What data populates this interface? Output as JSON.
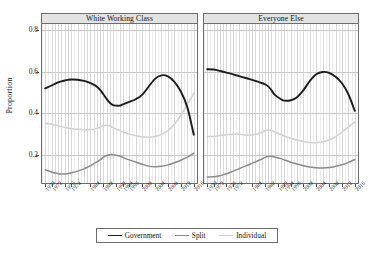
{
  "chart_data": {
    "type": "line",
    "title": "",
    "xlabel": "",
    "ylabel": "Proportion",
    "ylim": [
      0.06,
      0.83
    ],
    "yticks": [
      0.2,
      0.4,
      0.6,
      0.8
    ],
    "ytick_labels": [
      "0.2",
      "0.4",
      "0.6",
      "0.8"
    ],
    "grid": true,
    "legend_position": "bottom",
    "x": [
      1970,
      1972,
      1973,
      1974,
      1975,
      1976,
      1977,
      1978,
      1980,
      1982,
      1983,
      1984,
      1985,
      1986,
      1987,
      1988,
      1989,
      1990,
      1991,
      1993,
      1994,
      1996,
      1998,
      2000,
      2002,
      2004,
      2006,
      2008,
      2010,
      2012,
      2014,
      2016
    ],
    "xtick_labels": [
      "1970",
      "1972",
      "1976",
      "1978",
      "1984",
      "1988",
      "1992",
      "1994",
      "1996",
      "2000",
      "2004",
      "2008",
      "2012",
      "2016"
    ],
    "xtick_values": [
      1970,
      1972,
      1976,
      1978,
      1984,
      1988,
      1992,
      1994,
      1996,
      2000,
      2004,
      2008,
      2012,
      2016
    ],
    "xlim": [
      1969,
      2017
    ],
    "panels": [
      {
        "title": "White Working Class",
        "series": [
          {
            "name": "Government",
            "color": "#1c1c1c",
            "width": 1.9,
            "values": [
              0.52,
              0.534,
              0.542,
              0.549,
              0.554,
              0.558,
              0.561,
              0.563,
              0.562,
              0.556,
              0.551,
              0.545,
              0.538,
              0.528,
              0.513,
              0.492,
              0.47,
              0.451,
              0.44,
              0.437,
              0.443,
              0.455,
              0.468,
              0.489,
              0.528,
              0.566,
              0.583,
              0.578,
              0.552,
              0.505,
              0.43,
              0.297
            ]
          },
          {
            "name": "Split",
            "color": "#8a8a8a",
            "width": 1.5,
            "values": [
              0.128,
              0.118,
              0.113,
              0.11,
              0.108,
              0.108,
              0.11,
              0.113,
              0.122,
              0.133,
              0.14,
              0.148,
              0.157,
              0.166,
              0.176,
              0.189,
              0.197,
              0.201,
              0.201,
              0.195,
              0.188,
              0.176,
              0.166,
              0.155,
              0.146,
              0.143,
              0.145,
              0.152,
              0.162,
              0.174,
              0.189,
              0.208
            ]
          },
          {
            "name": "Individual",
            "color": "#d2d2d2",
            "width": 1.5,
            "values": [
              0.352,
              0.348,
              0.344,
              0.34,
              0.336,
              0.332,
              0.329,
              0.327,
              0.323,
              0.321,
              0.321,
              0.322,
              0.324,
              0.328,
              0.333,
              0.34,
              0.343,
              0.34,
              0.331,
              0.318,
              0.311,
              0.3,
              0.293,
              0.287,
              0.285,
              0.289,
              0.299,
              0.317,
              0.348,
              0.391,
              0.443,
              0.496
            ]
          }
        ]
      },
      {
        "title": "Everyone Else",
        "series": [
          {
            "name": "Government",
            "color": "#1c1c1c",
            "width": 1.9,
            "values": [
              0.612,
              0.611,
              0.608,
              0.604,
              0.6,
              0.596,
              0.592,
              0.588,
              0.579,
              0.57,
              0.566,
              0.561,
              0.556,
              0.551,
              0.546,
              0.54,
              0.53,
              0.512,
              0.49,
              0.468,
              0.461,
              0.463,
              0.478,
              0.512,
              0.556,
              0.588,
              0.599,
              0.595,
              0.576,
              0.545,
              0.492,
              0.412
            ]
          },
          {
            "name": "Split",
            "color": "#8a8a8a",
            "width": 1.5,
            "values": [
              0.094,
              0.095,
              0.097,
              0.1,
              0.104,
              0.109,
              0.115,
              0.121,
              0.134,
              0.147,
              0.153,
              0.159,
              0.166,
              0.173,
              0.18,
              0.188,
              0.192,
              0.193,
              0.19,
              0.182,
              0.176,
              0.165,
              0.156,
              0.148,
              0.142,
              0.138,
              0.137,
              0.139,
              0.145,
              0.153,
              0.164,
              0.178
            ]
          },
          {
            "name": "Individual",
            "color": "#d2d2d2",
            "width": 1.5,
            "values": [
              0.288,
              0.289,
              0.291,
              0.293,
              0.295,
              0.297,
              0.298,
              0.299,
              0.299,
              0.296,
              0.295,
              0.296,
              0.299,
              0.303,
              0.309,
              0.316,
              0.32,
              0.318,
              0.31,
              0.298,
              0.291,
              0.28,
              0.272,
              0.265,
              0.26,
              0.259,
              0.263,
              0.272,
              0.288,
              0.309,
              0.334,
              0.358
            ]
          }
        ]
      }
    ],
    "legend": [
      {
        "label": "Government",
        "color": "#1c1c1c"
      },
      {
        "label": "Split",
        "color": "#8a8a8a"
      },
      {
        "label": "Individual",
        "color": "#d2d2d2"
      }
    ]
  }
}
